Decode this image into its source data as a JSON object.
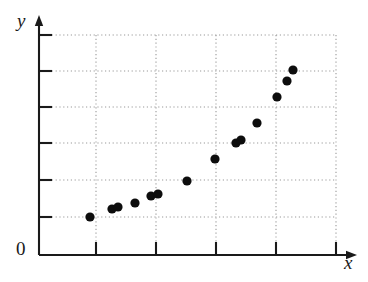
{
  "chart_data": {
    "type": "scatter",
    "title": "",
    "xlabel": "x",
    "ylabel": "y",
    "origin_label": "0",
    "grid": true,
    "legend": "none",
    "x_tick_labels": [],
    "y_tick_labels": [],
    "xlim": [
      0,
      5.28
    ],
    "ylim": [
      0,
      6.64
    ],
    "x_gridline_values": [
      1,
      2,
      3,
      4,
      5
    ],
    "y_gridline_values": [
      1,
      2,
      3,
      4,
      5,
      6
    ],
    "n_points": 14,
    "points": [
      {
        "x": 0.85,
        "y": 1.04
      },
      {
        "x": 1.22,
        "y": 1.26
      },
      {
        "x": 1.32,
        "y": 1.31
      },
      {
        "x": 1.6,
        "y": 1.42
      },
      {
        "x": 1.87,
        "y": 1.61
      },
      {
        "x": 1.98,
        "y": 1.66
      },
      {
        "x": 2.47,
        "y": 2.03
      },
      {
        "x": 2.93,
        "y": 2.63
      },
      {
        "x": 3.28,
        "y": 3.07
      },
      {
        "x": 3.37,
        "y": 3.15
      },
      {
        "x": 3.64,
        "y": 3.61
      },
      {
        "x": 3.97,
        "y": 4.33
      },
      {
        "x": 4.13,
        "y": 4.76
      },
      {
        "x": 4.23,
        "y": 5.06
      }
    ],
    "pixel_geometry": {
      "y_axis_x": 39,
      "x_axis_y": 255,
      "y_axis_top": 16,
      "x_axis_right": 356,
      "y_gridlines_px": [
        35,
        71,
        107,
        143,
        180,
        217
      ],
      "x_gridlines_px": [
        96,
        156,
        216,
        276,
        336
      ],
      "points_px": [
        {
          "cx": 90,
          "cy": 217
        },
        {
          "cx": 112,
          "cy": 209
        },
        {
          "cx": 118,
          "cy": 207
        },
        {
          "cx": 135,
          "cy": 203
        },
        {
          "cx": 151,
          "cy": 196
        },
        {
          "cx": 158,
          "cy": 194
        },
        {
          "cx": 187,
          "cy": 181
        },
        {
          "cx": 215,
          "cy": 159
        },
        {
          "cx": 236,
          "cy": 143
        },
        {
          "cx": 241,
          "cy": 140
        },
        {
          "cx": 257,
          "cy": 123
        },
        {
          "cx": 277,
          "cy": 97
        },
        {
          "cx": 287,
          "cy": 81
        },
        {
          "cx": 293,
          "cy": 70
        }
      ],
      "marker_radius": 4.6
    },
    "colors": {
      "axis": "#1a1a1a",
      "grid": "#9a9a9a",
      "marker": "#0d0d0d",
      "background": "#ffffff"
    }
  }
}
